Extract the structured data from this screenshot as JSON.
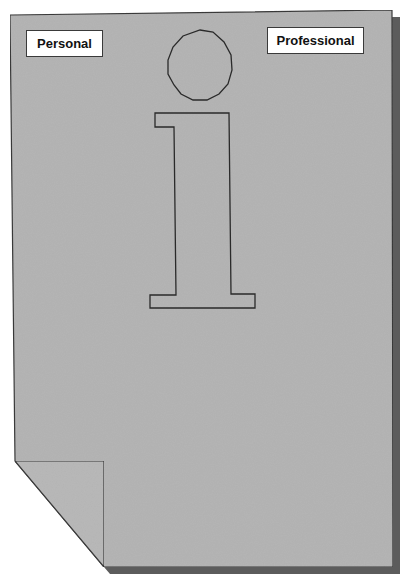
{
  "diagram": {
    "title_glyph": "i",
    "labels": {
      "personal": "Personal",
      "professional": "Professional"
    },
    "page": {
      "fill_color": "#b4b4b4",
      "outline_color": "#3a3a3a",
      "shadow_color": "#5a5a5a",
      "corner": "folded-bottom-left"
    },
    "icons": [
      "info-i-icon",
      "dog-ear-fold-icon"
    ]
  }
}
